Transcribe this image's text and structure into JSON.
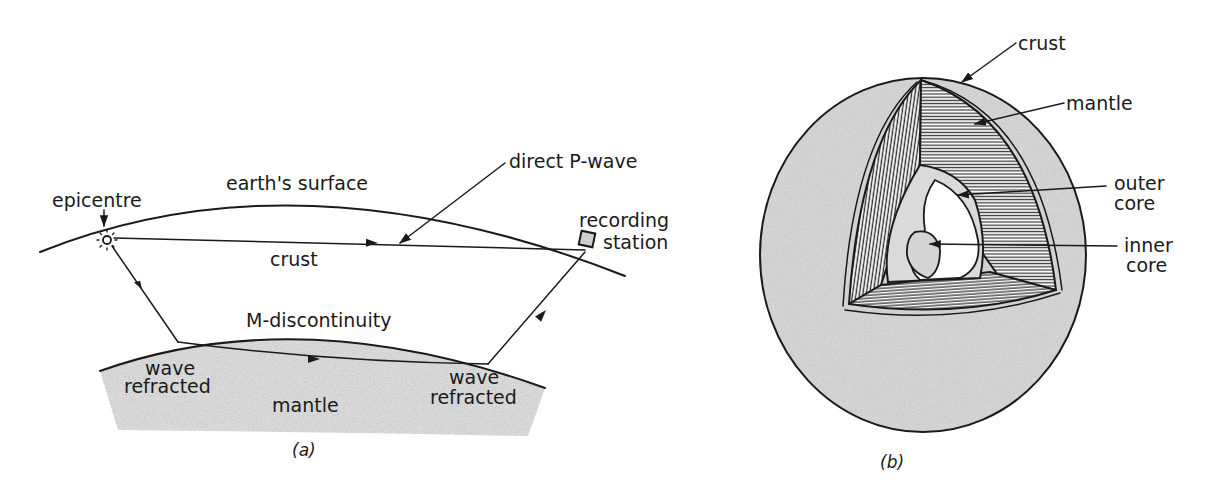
{
  "figure": {
    "panels": [
      {
        "id": "a",
        "caption": "(a)",
        "title": "Refraction of seismic waves at the M-discontinuity",
        "labels": {
          "epicentre": "epicentre",
          "earth_surface": "earth's surface",
          "direct_p_wave": "direct P-wave",
          "recording_station_line1": "recording",
          "recording_station_line2": "station",
          "crust": "crust",
          "m_discontinuity": "M-discontinuity",
          "wave_refracted_left_line1": "wave",
          "wave_refracted_left_line2": "refracted",
          "mantle": "mantle",
          "wave_refracted_right_line1": "wave",
          "wave_refracted_right_line2": "refracted"
        }
      },
      {
        "id": "b",
        "caption": "(b)",
        "title": "Cut-away view of the Earth's interior",
        "labels": {
          "crust": "crust",
          "mantle": "mantle",
          "outer_core_line1": "outer",
          "outer_core_line2": "core",
          "inner_core_line1": "inner",
          "inner_core_line2": "core"
        }
      }
    ],
    "colors": {
      "ink": "#1a1a1a",
      "stipple_fill": "#d9d9d9",
      "hatch": "#3a3a3a",
      "background": "#ffffff"
    }
  }
}
